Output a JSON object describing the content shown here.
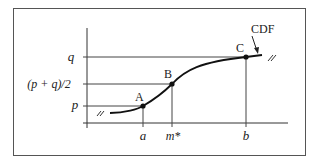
{
  "figure": {
    "type": "cdf-diagram",
    "curve_label": "CDF",
    "y_labels": {
      "q": "q",
      "mid": "(p + q)/2",
      "p": "p"
    },
    "x_labels": {
      "a": "a",
      "m": "m*",
      "b": "b"
    },
    "points": [
      {
        "id": "A",
        "label": "A"
      },
      {
        "id": "B",
        "label": "B"
      },
      {
        "id": "C",
        "label": "C"
      }
    ],
    "break_mark": "//",
    "colors": {
      "line": "#333333",
      "frame": "#555555",
      "curve": "#111111",
      "background": "#ffffff"
    }
  }
}
